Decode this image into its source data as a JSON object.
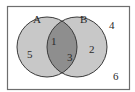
{
  "diagram": {
    "type": "venn",
    "sets": [
      {
        "name": "A",
        "label": "A"
      },
      {
        "name": "B",
        "label": "B"
      }
    ],
    "regions": {
      "only_A": "5",
      "A_and_B_upper": "1",
      "A_and_B_lower": "3",
      "only_B": "2",
      "outside_top": "4",
      "outside_bottom": "6"
    },
    "colors": {
      "universe_border": "#6e6e6e",
      "circle_fill": "#c8c8c8",
      "intersection_fill": "#8e8e8e",
      "circle_stroke": "#3a3a3a",
      "text": "#2a2a2a",
      "background": "#ffffff"
    }
  }
}
